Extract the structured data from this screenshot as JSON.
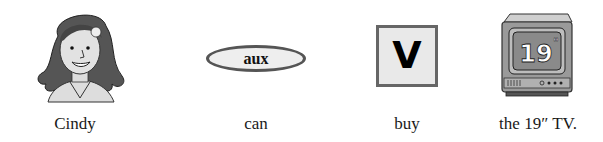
{
  "items": [
    {
      "id": "cindy",
      "figure": "girl-portrait-illustration",
      "label": "Cindy"
    },
    {
      "id": "aux",
      "figure": "oval-node",
      "node_text": "aux",
      "label": "can"
    },
    {
      "id": "v",
      "figure": "square-node",
      "node_text": "V",
      "label": "buy"
    },
    {
      "id": "tv",
      "figure": "television-illustration",
      "screen_text": "19\"",
      "label": "the 19″ TV."
    }
  ],
  "colors": {
    "node_fill": "#eeeeee",
    "node_border": "#555555",
    "text": "#1a1a1a"
  }
}
